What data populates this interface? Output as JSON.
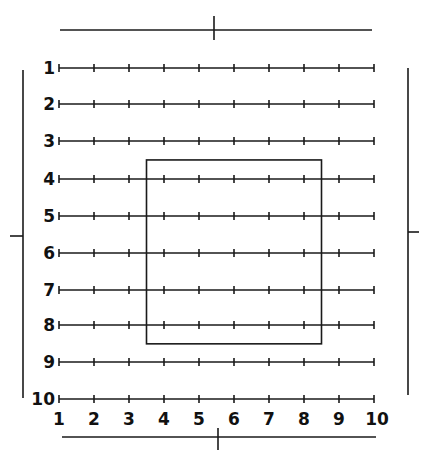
{
  "diagram": {
    "type": "grid-layout-diagram",
    "row_labels": [
      "1",
      "2",
      "3",
      "4",
      "5",
      "6",
      "7",
      "8",
      "9",
      "10"
    ],
    "column_labels": [
      "1",
      "2",
      "3",
      "4",
      "5",
      "6",
      "7",
      "8",
      "9",
      "10"
    ],
    "highlight_rect": {
      "col_from": 3.5,
      "col_to": 8.5,
      "row_from": 3.5,
      "row_to": 8.5
    },
    "colors": {
      "ink": "#1a1a1a",
      "background": "#ffffff"
    }
  }
}
